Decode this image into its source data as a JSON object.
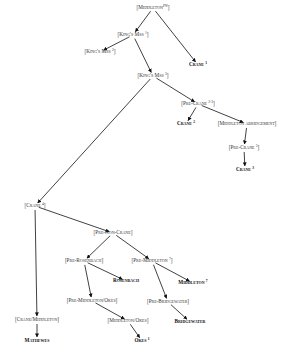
{
  "diagram": {
    "type": "stemma",
    "nodes": [
      {
        "id": "middleton_pw",
        "label": "[Middleton",
        "sup": "Pw",
        "close": "]",
        "kind": "hypothetical"
      },
      {
        "id": "kings_mss_1",
        "label": "[King's Mss ",
        "sup": "1",
        "close": "]",
        "kind": "hypothetical"
      },
      {
        "id": "kings_mss_2",
        "label": "[King's Mss ",
        "sup": "2",
        "close": "]",
        "kind": "hypothetical"
      },
      {
        "id": "crane_1",
        "label": "Crane ",
        "sup": "1",
        "close": "",
        "kind": "witness"
      },
      {
        "id": "kings_mss_3",
        "label": "[King's Mss ",
        "sup": "3",
        "close": "]",
        "kind": "hypothetical"
      },
      {
        "id": "pre_crane_2_3",
        "label": "[Pre-Crane ",
        "sup": "2-3",
        "close": "]",
        "kind": "hypothetical"
      },
      {
        "id": "crane_2",
        "label": "Crane ",
        "sup": "2",
        "close": "",
        "kind": "witness"
      },
      {
        "id": "middleton_abridgement",
        "label": "[Middleton abridgement",
        "sup": "",
        "close": "]",
        "kind": "hypothetical"
      },
      {
        "id": "pre_crane_3",
        "label": "[Pre-Crane ",
        "sup": "3",
        "close": "]",
        "kind": "hypothetical"
      },
      {
        "id": "crane_3",
        "label": "Crane ",
        "sup": "3",
        "close": "",
        "kind": "witness"
      },
      {
        "id": "crane_4",
        "label": "[Crane ",
        "sup": "4",
        "close": "]",
        "kind": "hypothetical"
      },
      {
        "id": "pre_non_crane",
        "label": "[Pre-Non-Crane",
        "sup": "",
        "close": "]",
        "kind": "hypothetical"
      },
      {
        "id": "pre_rosenbach",
        "label": "[Pre-Rosenbach",
        "sup": "",
        "close": "]",
        "kind": "hypothetical"
      },
      {
        "id": "pre_middleton_7",
        "label": "[Pre-Middleton ",
        "sup": "7",
        "close": "]",
        "kind": "hypothetical"
      },
      {
        "id": "rosenbach",
        "label": "Rosenbach",
        "sup": "",
        "close": "",
        "kind": "witness"
      },
      {
        "id": "middleton_7",
        "label": "Middleton ",
        "sup": "7",
        "close": "",
        "kind": "witness"
      },
      {
        "id": "pre_middleton_okes",
        "label": "[Pre-Middleton/Okes",
        "sup": "",
        "close": "]",
        "kind": "hypothetical"
      },
      {
        "id": "pre_bridgewater",
        "label": "[Pre-Bridgewater",
        "sup": "",
        "close": "]",
        "kind": "hypothetical"
      },
      {
        "id": "middleton_okes",
        "label": "[Middleton/Okes",
        "sup": "",
        "close": "]",
        "kind": "hypothetical"
      },
      {
        "id": "bridgewater",
        "label": "Bridgewater",
        "sup": "",
        "close": "",
        "kind": "witness"
      },
      {
        "id": "okes_1",
        "label": "Okes ",
        "sup": "1",
        "close": "",
        "kind": "witness"
      },
      {
        "id": "crane_middleton",
        "label": "[Crane/Middleton",
        "sup": "",
        "close": "]",
        "kind": "hypothetical"
      },
      {
        "id": "mathewes",
        "label": "Mathewes",
        "sup": "",
        "close": "",
        "kind": "witness"
      }
    ],
    "edges": [
      [
        "middleton_pw",
        "kings_mss_1"
      ],
      [
        "middleton_pw",
        "crane_1"
      ],
      [
        "kings_mss_1",
        "kings_mss_2"
      ],
      [
        "kings_mss_1",
        "kings_mss_3"
      ],
      [
        "kings_mss_3",
        "pre_crane_2_3"
      ],
      [
        "kings_mss_3",
        "crane_4"
      ],
      [
        "pre_crane_2_3",
        "crane_2"
      ],
      [
        "pre_crane_2_3",
        "middleton_abridgement"
      ],
      [
        "middleton_abridgement",
        "pre_crane_3"
      ],
      [
        "pre_crane_3",
        "crane_3"
      ],
      [
        "crane_4",
        "crane_middleton"
      ],
      [
        "crane_4",
        "pre_non_crane"
      ],
      [
        "pre_non_crane",
        "pre_rosenbach"
      ],
      [
        "pre_non_crane",
        "pre_middleton_7"
      ],
      [
        "pre_rosenbach",
        "rosenbach"
      ],
      [
        "pre_rosenbach",
        "pre_middleton_okes"
      ],
      [
        "pre_middleton_7",
        "middleton_7"
      ],
      [
        "pre_middleton_7",
        "pre_bridgewater"
      ],
      [
        "pre_middleton_okes",
        "middleton_okes"
      ],
      [
        "pre_bridgewater",
        "bridgewater"
      ],
      [
        "middleton_okes",
        "okes_1"
      ],
      [
        "crane_middleton",
        "mathewes"
      ]
    ]
  }
}
